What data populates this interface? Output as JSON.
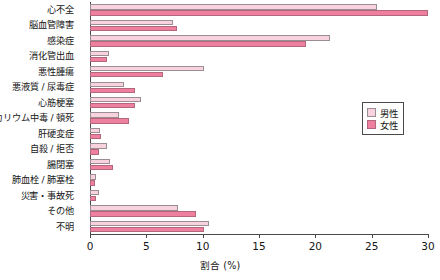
{
  "chart_data": {
    "type": "bar",
    "orientation": "horizontal",
    "title": "",
    "xlabel": "割合 (%)",
    "ylabel": "",
    "xlim": [
      0,
      30
    ],
    "xticks": [
      0,
      5,
      10,
      15,
      20,
      25,
      30
    ],
    "xtick_labels": [
      "0",
      "5",
      "10",
      "15",
      "20",
      "25",
      "30"
    ],
    "grid": false,
    "legend_position": "right",
    "categories": [
      "心不全",
      "脳血管障害",
      "感染症",
      "消化管出血",
      "悪性腫瘍",
      "悪液質 / 尿毒症",
      "心筋梗塞",
      "カリウム中毒 / 頓死",
      "肝硬変症",
      "自殺 / 拒否",
      "腸閉塞",
      "肺血栓 / 肺塞栓",
      "災害・事故死",
      "その他",
      "不明"
    ],
    "series": [
      {
        "name": "男性",
        "color": "#f8d2dc",
        "values": [
          25.5,
          7.4,
          21.3,
          1.7,
          10.1,
          3.0,
          4.5,
          2.6,
          0.9,
          1.5,
          1.8,
          0.5,
          0.8,
          7.8,
          10.6
        ]
      },
      {
        "name": "女性",
        "color": "#ef7f9e",
        "values": [
          30.0,
          7.7,
          19.2,
          1.5,
          6.5,
          4.0,
          4.0,
          3.5,
          1.0,
          0.8,
          2.0,
          0.4,
          0.5,
          9.4,
          10.1
        ]
      }
    ]
  },
  "legend": {
    "items": [
      {
        "label": "男性",
        "swatch": "male"
      },
      {
        "label": "女性",
        "swatch": "female"
      }
    ]
  }
}
